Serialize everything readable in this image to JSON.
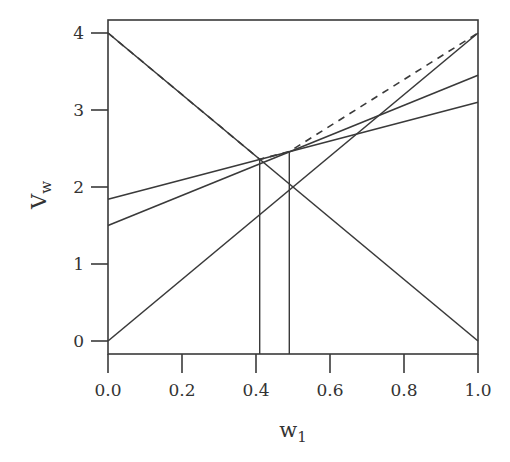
{
  "chart_data": {
    "type": "line",
    "title": "",
    "xlabel": "w1",
    "ylabel": "Vw",
    "xlim": [
      0,
      1
    ],
    "ylim": [
      -0.17,
      4.17
    ],
    "xticks": [
      "0.0",
      "0.2",
      "0.4",
      "0.6",
      "0.8",
      "1.0"
    ],
    "yticks": [
      "0",
      "1",
      "2",
      "3",
      "4"
    ],
    "grid": false,
    "legend": null,
    "series": [
      {
        "name": "line-descending",
        "style": "solid",
        "x": [
          0,
          1
        ],
        "y": [
          4,
          0
        ]
      },
      {
        "name": "line-ascending",
        "style": "solid",
        "x": [
          0,
          1
        ],
        "y": [
          0,
          4
        ]
      },
      {
        "name": "line-a",
        "style": "solid",
        "x": [
          0,
          1
        ],
        "y": [
          1.84,
          3.1
        ]
      },
      {
        "name": "line-b",
        "style": "solid",
        "x": [
          0,
          1
        ],
        "y": [
          1.5,
          3.45
        ]
      },
      {
        "name": "upper-envelope",
        "style": "dashed",
        "x": [
          0,
          0.41,
          0.49,
          1
        ],
        "y": [
          4,
          2.36,
          2.46,
          4
        ]
      }
    ],
    "vertical_markers": [
      {
        "x": 0.41,
        "y_top": 2.36
      },
      {
        "x": 0.49,
        "y_top": 2.46
      }
    ]
  },
  "labels": {
    "xlabel_main": "w",
    "xlabel_sub": "1",
    "ylabel_main": "V",
    "ylabel_sub": "w"
  }
}
